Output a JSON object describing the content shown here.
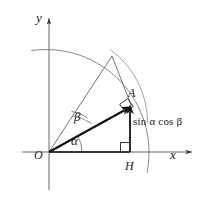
{
  "figure": {
    "kind": "geometry-diagram",
    "width": 202,
    "height": 197,
    "background_color": "#ffffff",
    "stroke_color": "#555555",
    "bold_stroke_color": "#1a1a1a",
    "label_color": "#1a1a1a"
  },
  "axes": {
    "x_label": "x",
    "y_label": "y",
    "origin_label": "O",
    "x_axis_y": 152,
    "y_axis_x": 49,
    "x_axis_from": 22,
    "x_axis_to": 196,
    "y_axis_from": 14,
    "y_axis_to": 190
  },
  "points": [
    {
      "name": "O",
      "label": "O",
      "x": 49,
      "y": 152
    },
    {
      "name": "H",
      "label": "H",
      "x": 130,
      "y": 152
    },
    {
      "name": "A",
      "label": "A",
      "x": 130,
      "y": 108
    },
    {
      "name": "P",
      "label": "",
      "x": 112,
      "y": 56
    }
  ],
  "angles": [
    {
      "name": "alpha",
      "label": "α",
      "vertex": "O",
      "between": [
        "x-axis",
        "OA"
      ],
      "arc_radius": 30
    },
    {
      "name": "beta",
      "label": "β",
      "vertex": "O",
      "between": [
        "OA",
        "OP"
      ],
      "arc_radius": 45
    }
  ],
  "arcs": {
    "unit_circle": {
      "center": "O",
      "radius": 103,
      "from_deg": 100,
      "to_deg": -18
    },
    "inner_arc": {
      "center": "O",
      "radius": 91,
      "from_deg": 42,
      "to_deg": 6
    }
  },
  "segments": [
    {
      "name": "OA",
      "from": "O",
      "to": "A",
      "style": "bold-arrow"
    },
    {
      "name": "OP",
      "from": "O",
      "to": "P",
      "style": "thin"
    },
    {
      "name": "PA",
      "from": "P",
      "to": "A",
      "style": "thin"
    },
    {
      "name": "OH",
      "from": "O",
      "to": "H",
      "style": "bold"
    },
    {
      "name": "HA",
      "from": "H",
      "to": "A",
      "style": "bold-arrow"
    }
  ],
  "right_angles": [
    {
      "name": "right-angle-at-H",
      "at": "H",
      "size": 9
    },
    {
      "name": "right-angle-at-A",
      "at": "A",
      "size": 9
    }
  ],
  "annotations": [
    {
      "name": "sin-alpha-cos-beta-label",
      "text": "sin α cos β",
      "describes": "HA",
      "x": 133,
      "y": 116
    }
  ]
}
